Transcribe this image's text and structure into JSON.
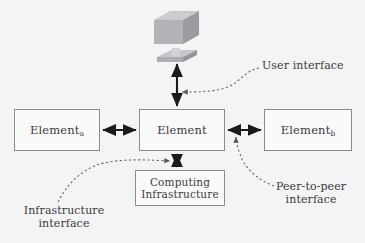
{
  "diagram": {
    "background_color": "#f4f3f5",
    "line_color": "#1a1a1a",
    "box_border_color": "#8d8c90",
    "box_fill_color": "#fbfafb",
    "text_color": "#3b3a3d",
    "icon_color": "#a9a8ac"
  },
  "nodes": {
    "element_a": {
      "label": "Element",
      "subscript": "a"
    },
    "element": {
      "label": "Element",
      "subscript": ""
    },
    "element_b": {
      "label": "Element",
      "subscript": "b"
    },
    "computing_infrastructure": {
      "line1": "Computing",
      "line2": "Infrastructure"
    },
    "user_icon": {
      "name": "computer-workstation-icon"
    }
  },
  "callouts": {
    "user_interface": {
      "line1": "User interface",
      "line2": ""
    },
    "peer_to_peer": {
      "line1": "Peer-to-peer",
      "line2": "interface"
    },
    "infrastructure": {
      "line1": "Infrastructure",
      "line2": "interface"
    }
  },
  "connectors": [
    {
      "name": "element-to-user-icon",
      "style": "double-arrow",
      "orientation": "vertical"
    },
    {
      "name": "element-a-to-element",
      "style": "double-arrow",
      "orientation": "horizontal"
    },
    {
      "name": "element-to-element-b",
      "style": "double-arrow",
      "orientation": "horizontal"
    },
    {
      "name": "element-to-computing-infrastructure",
      "style": "double-arrow",
      "orientation": "vertical"
    },
    {
      "name": "user-interface-leader",
      "style": "dashed-curve"
    },
    {
      "name": "peer-to-peer-leader",
      "style": "dashed-curve"
    },
    {
      "name": "infrastructure-leader",
      "style": "dashed-curve"
    }
  ]
}
